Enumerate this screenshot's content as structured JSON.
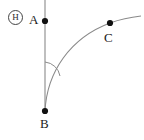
{
  "figure": {
    "kind": "geometry-diagram",
    "width": 144,
    "height": 140,
    "background_color": "#ffffff",
    "stroke_color": "#7a7a7a",
    "point_color": "#111111",
    "label_color": "#1a1a1a"
  },
  "badge": {
    "text": "H",
    "shape": "circle"
  },
  "points": [
    {
      "id": "A",
      "label": "A",
      "x": 45,
      "y": 21,
      "label_x": 29,
      "label_y": 13
    },
    {
      "id": "B",
      "label": "B",
      "x": 45,
      "y": 111,
      "label_x": 40,
      "label_y": 117
    },
    {
      "id": "C",
      "label": "C",
      "x": 110,
      "y": 23,
      "label_x": 104,
      "label_y": 31
    }
  ],
  "segments": [
    {
      "id": "vertical-line",
      "name": "line-through-A-and-B",
      "x1": 45,
      "y1": 0,
      "x2": 45,
      "y2": 111
    }
  ],
  "curves": [
    {
      "id": "arc-BC",
      "name": "curve-from-B-through-C",
      "path": "M 45 111 C 47 72, 70 38, 110 23 C 121 19, 132 17, 141 16"
    }
  ],
  "angle_marks": [
    {
      "id": "angle-at-B",
      "vertex": "B",
      "path": "M 45 62 A 17 17 0 0 1 60 76"
    }
  ]
}
